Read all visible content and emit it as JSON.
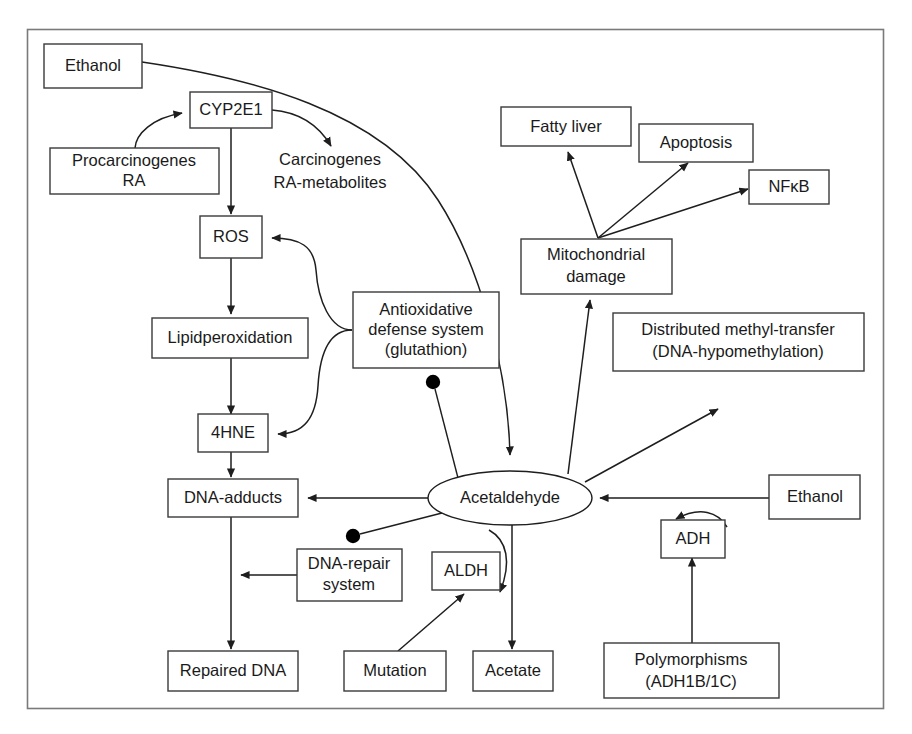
{
  "diagram": {
    "frame": {
      "stroke": "#7a7a7a"
    },
    "nodes": [
      {
        "id": "ethanol_top",
        "shape": "box",
        "lines": [
          "Ethanol"
        ]
      },
      {
        "id": "cyp2e1",
        "shape": "box",
        "lines": [
          "CYP2E1"
        ]
      },
      {
        "id": "procarcinogenes",
        "shape": "box",
        "lines": [
          "Procarcinogenes",
          "RA"
        ]
      },
      {
        "id": "carcinogenes",
        "shape": "text",
        "lines": [
          "Carcinogenes",
          "RA-metabolites"
        ]
      },
      {
        "id": "ros",
        "shape": "box",
        "lines": [
          "ROS"
        ]
      },
      {
        "id": "lipidperoxidation",
        "shape": "box",
        "lines": [
          "Lipidperoxidation"
        ]
      },
      {
        "id": "hne4",
        "shape": "box",
        "lines": [
          "4HNE"
        ]
      },
      {
        "id": "antioxidative",
        "shape": "box",
        "lines": [
          "Antioxidative",
          "defense system",
          "(glutathion)"
        ]
      },
      {
        "id": "dna_adducts",
        "shape": "box",
        "lines": [
          "DNA-adducts"
        ]
      },
      {
        "id": "dna_repair",
        "shape": "box",
        "lines": [
          "DNA-repair",
          "system"
        ]
      },
      {
        "id": "repaired_dna",
        "shape": "box",
        "lines": [
          "Repaired DNA"
        ]
      },
      {
        "id": "mutation",
        "shape": "box",
        "lines": [
          "Mutation"
        ]
      },
      {
        "id": "aldh",
        "shape": "box",
        "lines": [
          "ALDH"
        ]
      },
      {
        "id": "acetate",
        "shape": "box",
        "lines": [
          "Acetate"
        ]
      },
      {
        "id": "acetaldehyde",
        "shape": "ellipse",
        "lines": [
          "Acetaldehyde"
        ]
      },
      {
        "id": "fatty_liver",
        "shape": "box",
        "lines": [
          "Fatty liver"
        ]
      },
      {
        "id": "apoptosis",
        "shape": "box",
        "lines": [
          "Apoptosis"
        ]
      },
      {
        "id": "nfkb",
        "shape": "box",
        "lines": [
          "NFκB"
        ]
      },
      {
        "id": "mitochondrial",
        "shape": "box",
        "lines": [
          "Mitochondrial",
          "damage"
        ]
      },
      {
        "id": "methyl_transfer",
        "shape": "box",
        "lines": [
          "Distributed methyl-transfer",
          "(DNA-hypomethylation)"
        ]
      },
      {
        "id": "ethanol_right",
        "shape": "box",
        "lines": [
          "Ethanol"
        ]
      },
      {
        "id": "adh",
        "shape": "box",
        "lines": [
          "ADH"
        ]
      },
      {
        "id": "polymorphisms",
        "shape": "box",
        "lines": [
          "Polymorphisms",
          "(ADH1B/1C)"
        ]
      }
    ],
    "labels": {
      "ethanol_top": "Ethanol",
      "cyp2e1": "CYP2E1",
      "procarcinogenes_l1": "Procarcinogenes",
      "procarcinogenes_l2": "RA",
      "carcinogenes_l1": "Carcinogenes",
      "carcinogenes_l2": "RA-metabolites",
      "ros": "ROS",
      "lipidperoxidation": "Lipidperoxidation",
      "hne4": "4HNE",
      "antioxidative_l1": "Antioxidative",
      "antioxidative_l2": "defense system",
      "antioxidative_l3": "(glutathion)",
      "dna_adducts": "DNA-adducts",
      "dna_repair_l1": "DNA-repair",
      "dna_repair_l2": "system",
      "repaired_dna": "Repaired DNA",
      "mutation": "Mutation",
      "aldh": "ALDH",
      "acetate": "Acetate",
      "acetaldehyde": "Acetaldehyde",
      "fatty_liver": "Fatty liver",
      "apoptosis": "Apoptosis",
      "nfkb": "NFκB",
      "mitochondrial_l1": "Mitochondrial",
      "mitochondrial_l2": "damage",
      "methyl_transfer_l1": "Distributed methyl-transfer",
      "methyl_transfer_l2": "(DNA-hypomethylation)",
      "ethanol_right": "Ethanol",
      "adh": "ADH",
      "polymorphisms_l1": "Polymorphisms",
      "polymorphisms_l2": "(ADH1B/1C)"
    },
    "edges": [
      {
        "id": "ethanol-to-acetaldehyde",
        "from": "ethanol_top",
        "to": "acetaldehyde",
        "marker": "arrow"
      },
      {
        "id": "procarcinogenes-to-cyp2e1",
        "from": "procarcinogenes",
        "to": "cyp2e1",
        "marker": "arrow"
      },
      {
        "id": "cyp2e1-to-carcinogenes",
        "from": "cyp2e1",
        "to": "carcinogenes",
        "marker": "arrow"
      },
      {
        "id": "cyp2e1-to-ros",
        "from": "cyp2e1",
        "to": "ros",
        "marker": "arrow"
      },
      {
        "id": "ros-to-lipidperoxidation",
        "from": "ros",
        "to": "lipidperoxidation",
        "marker": "arrow"
      },
      {
        "id": "lipidperoxidation-to-4hne",
        "from": "lipidperoxidation",
        "to": "hne4",
        "marker": "arrow"
      },
      {
        "id": "antioxidative-to-ros",
        "from": "antioxidative",
        "to": "ros",
        "marker": "arrow"
      },
      {
        "id": "antioxidative-to-4hne",
        "from": "antioxidative",
        "to": "hne4",
        "marker": "arrow"
      },
      {
        "id": "4hne-to-dna-adducts",
        "from": "hne4",
        "to": "dna_adducts",
        "marker": "arrow"
      },
      {
        "id": "acetaldehyde-to-dna-adducts",
        "from": "acetaldehyde",
        "to": "dna_adducts",
        "marker": "arrow"
      },
      {
        "id": "acetaldehyde-inhibits-antioxidative",
        "from": "acetaldehyde",
        "to": "antioxidative",
        "marker": "dot"
      },
      {
        "id": "acetaldehyde-inhibits-dna-repair",
        "from": "acetaldehyde",
        "to": "dna_repair",
        "marker": "dot"
      },
      {
        "id": "dna-adducts-to-repaired-dna",
        "from": "dna_adducts",
        "to": "repaired_dna",
        "marker": "arrow"
      },
      {
        "id": "dna-repair-to-repair-path",
        "from": "dna_repair",
        "to": "dna_adducts",
        "marker": "arrow"
      },
      {
        "id": "mutation-to-aldh",
        "from": "mutation",
        "to": "aldh",
        "marker": "arrow"
      },
      {
        "id": "aldh-catalyzes-acetate",
        "from": "aldh",
        "to": "acetate",
        "marker": "arrow"
      },
      {
        "id": "acetaldehyde-to-acetate",
        "from": "acetaldehyde",
        "to": "acetate",
        "marker": "arrow"
      },
      {
        "id": "acetaldehyde-to-mitochondrial",
        "from": "acetaldehyde",
        "to": "mitochondrial",
        "marker": "arrow"
      },
      {
        "id": "acetaldehyde-to-methyl-transfer",
        "from": "acetaldehyde",
        "to": "methyl_transfer",
        "marker": "arrow"
      },
      {
        "id": "mitochondrial-to-fatty-liver",
        "from": "mitochondrial",
        "to": "fatty_liver",
        "marker": "arrow"
      },
      {
        "id": "mitochondrial-to-apoptosis",
        "from": "mitochondrial",
        "to": "apoptosis",
        "marker": "arrow"
      },
      {
        "id": "mitochondrial-to-nfkb",
        "from": "mitochondrial",
        "to": "nfkb",
        "marker": "arrow"
      },
      {
        "id": "ethanol-right-to-acetaldehyde",
        "from": "ethanol_right",
        "to": "acetaldehyde",
        "marker": "arrow"
      },
      {
        "id": "adh-catalyzes-acetaldehyde",
        "from": "adh",
        "to": "acetaldehyde",
        "marker": "arrow"
      },
      {
        "id": "polymorphisms-to-adh",
        "from": "polymorphisms",
        "to": "adh",
        "marker": "arrow"
      }
    ]
  }
}
